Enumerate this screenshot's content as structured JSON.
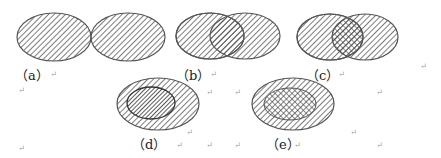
{
  "figures": [
    {
      "id": "a",
      "label": "（a）",
      "relation": "disjoint"
    },
    {
      "id": "b",
      "label": "（b）",
      "relation": "overlap-same-hatch"
    },
    {
      "id": "c",
      "label": "（c）",
      "relation": "overlap-cross-hatch"
    },
    {
      "id": "d",
      "label": "（d）",
      "relation": "nested-dense-hatch"
    },
    {
      "id": "e",
      "label": "（e）",
      "relation": "nested-cross-hatch"
    }
  ],
  "return_mark": "↵",
  "colors": {
    "stroke": "#555555",
    "hatch": "#444444",
    "background": "#ffffff"
  }
}
